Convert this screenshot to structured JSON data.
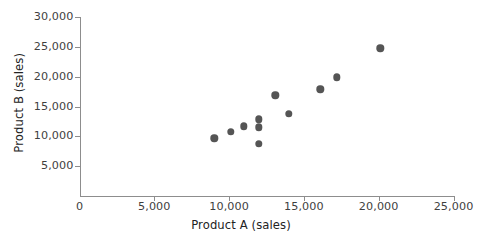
{
  "chart_data": {
    "type": "scatter",
    "title": "",
    "xlabel": "Product A (sales)",
    "ylabel": "Product B (sales)",
    "xlim": [
      0,
      25000
    ],
    "ylim": [
      0,
      30000
    ],
    "grid": false,
    "legend": null,
    "marker_color": "#555555",
    "axis_color": "#8d8d8d",
    "x_ticks": [
      0,
      5000,
      10000,
      15000,
      20000,
      25000
    ],
    "x_tick_labels": [
      "0",
      "5,000",
      "10,000",
      "15,000",
      "20,000",
      "25,000"
    ],
    "y_ticks": [
      5000,
      10000,
      15000,
      20000,
      25000,
      30000
    ],
    "y_tick_labels": [
      "5,000",
      "10,000",
      "15,000",
      "20,000",
      "25,000",
      "30,000"
    ],
    "points": [
      {
        "x": 9000,
        "y": 9700
      },
      {
        "x": 10100,
        "y": 10800
      },
      {
        "x": 11000,
        "y": 11700
      },
      {
        "x": 12000,
        "y": 12900
      },
      {
        "x": 12000,
        "y": 11500
      },
      {
        "x": 12000,
        "y": 8800
      },
      {
        "x": 13100,
        "y": 16900
      },
      {
        "x": 14000,
        "y": 13800
      },
      {
        "x": 16100,
        "y": 17900
      },
      {
        "x": 17200,
        "y": 19900
      },
      {
        "x": 20100,
        "y": 24800
      }
    ]
  }
}
